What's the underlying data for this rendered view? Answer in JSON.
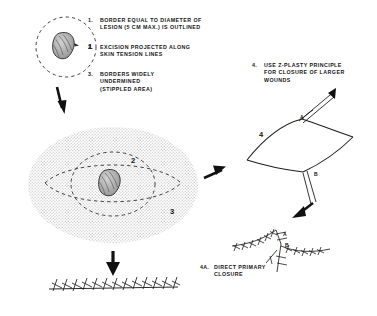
{
  "figure": {
    "caption": "",
    "background_color": "#ffffff",
    "ink_color": "#151515",
    "stipple_color": "#d8d8d8"
  },
  "steps": [
    {
      "number": "1.",
      "text": "BORDER EQUAL TO DIAMETER OF\nLESION (5 CM MAX.) IS OUTLINED"
    },
    {
      "number": "2.",
      "text": "EXCISION PROJECTED ALONG\nSKIN TENSION LINES"
    },
    {
      "number": "3.",
      "text": "BORDERS WIDELY\nUNDERMINED\n(STIPPLED AREA)"
    },
    {
      "number": "4.",
      "text": "USE Z-PLASTY PRINCIPLE\nFOR CLOSURE OF LARGER\nWOUNDS"
    },
    {
      "number": "4A.",
      "text": "DIRECT PRIMARY\nCLOSURE"
    }
  ],
  "figure_labels": {
    "lesion_circle": "1",
    "excision_ellipse": "2",
    "undermined_area": "3",
    "zplasty_flap": "4",
    "flap_a": "A",
    "flap_b": "B",
    "sutured_a": "A",
    "sutured_b": "B"
  },
  "panels": {
    "lesion_outline": {
      "name": "Lesion with outlined border",
      "marker": "1"
    },
    "undermining": {
      "name": "Excision projected along skin tension lines with stippled undermined area",
      "markers": [
        "2",
        "3"
      ]
    },
    "zplasty_flap": {
      "name": "Z-plasty flap transposition",
      "markers": [
        "4",
        "A",
        "B"
      ]
    },
    "zplasty_sutured": {
      "name": "Z-plasty sutured closure",
      "markers": [
        "A",
        "B"
      ]
    },
    "primary_closure": {
      "name": "Direct primary closure suture line",
      "suture_count": 13
    }
  },
  "arrows": [
    {
      "name": "arrow-down-to-undermining",
      "direction": "down"
    },
    {
      "name": "arrow-right-to-zplasty",
      "direction": "right"
    },
    {
      "name": "arrow-down-to-primary-closure",
      "direction": "down"
    },
    {
      "name": "arrow-down-to-zplasty-sutured",
      "direction": "down-left"
    }
  ]
}
